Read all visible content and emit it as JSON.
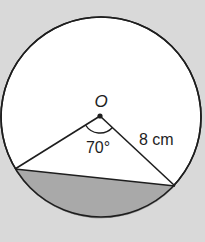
{
  "diagram": {
    "center_label": "O",
    "angle_label": "70°",
    "radius_label": "8 cm",
    "colors": {
      "background": "#d9d9d9",
      "circle_fill": "#ffffff",
      "segment_fill": "#a9a9a9",
      "stroke": "#1e1e1e"
    }
  }
}
